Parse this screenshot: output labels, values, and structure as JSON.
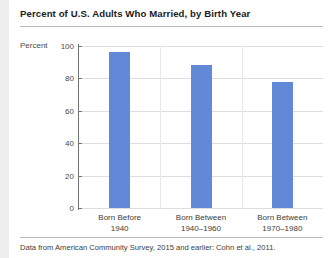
{
  "chart_data": {
    "type": "bar",
    "title": "Percent of U.S. Adults Who Married, by Birth Year",
    "xlabel": "",
    "ylabel": "Percent",
    "categories": [
      "Born Before\n1940",
      "Born Between\n1940–1960",
      "Born Between\n1970–1980"
    ],
    "category_lines": [
      [
        "Born Before",
        "1940"
      ],
      [
        "Born Between",
        "1940–1960"
      ],
      [
        "Born Between",
        "1970–1980"
      ]
    ],
    "values": [
      96.5,
      88.5,
      78
    ],
    "ylim": [
      0,
      100
    ],
    "yticks": [
      0,
      20,
      40,
      60,
      80,
      100
    ],
    "ytick_labels": [
      "0",
      "20",
      "40",
      "60",
      "80",
      "100"
    ],
    "grid": true,
    "legend": null,
    "bar_color": "#6289d8"
  },
  "figure": {
    "title": "Percent of U.S. Adults Who Married, by Birth Year",
    "y_axis_title": "Percent",
    "footnote": "Data from American Community Survey, 2015 and earlier: Cohn et al., 2011."
  },
  "colors": {
    "bar": "#6289d8",
    "axis": "#6f7376",
    "grid": "#dcdedf",
    "rule": "#b9bcbf",
    "text": "#231f20"
  }
}
